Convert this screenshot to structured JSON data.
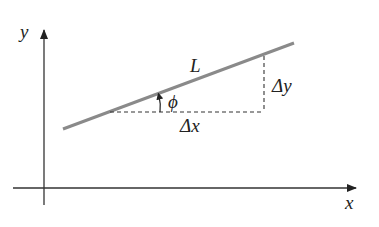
{
  "diagram": {
    "title": "",
    "axes": {
      "x_label": "x",
      "y_label": "y"
    },
    "line": {
      "label": "L",
      "color": "#8a8a8a"
    },
    "annotations": {
      "angle_label": "ϕ",
      "delta_x_label": "Δx",
      "delta_y_label": "Δy"
    },
    "colors": {
      "axis": "#222222",
      "dashed": "#333333",
      "text": "#222222"
    }
  }
}
